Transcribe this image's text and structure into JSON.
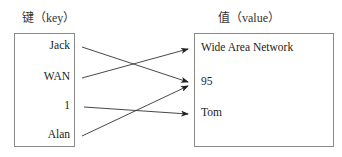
{
  "diagram": {
    "key_title": "键（key）",
    "value_title": "值（value）",
    "keys": [
      {
        "label": "Jack"
      },
      {
        "label": "WAN"
      },
      {
        "label": "1"
      },
      {
        "label": "Alan"
      }
    ],
    "values": [
      {
        "label": "Wide Area Network"
      },
      {
        "label": "95"
      },
      {
        "label": "Tom"
      }
    ],
    "mappings": [
      {
        "from": "Jack",
        "to": "95"
      },
      {
        "from": "WAN",
        "to": "Wide Area Network"
      },
      {
        "from": "1",
        "to": "Tom"
      },
      {
        "from": "Alan",
        "to": "95"
      }
    ]
  }
}
